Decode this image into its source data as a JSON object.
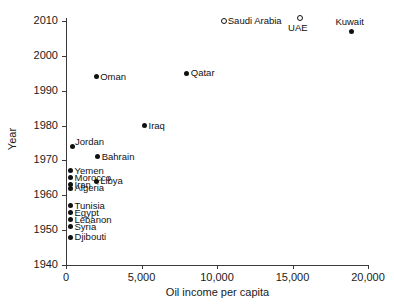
{
  "chart_data": {
    "type": "scatter",
    "title": "",
    "xlabel": "Oil income per capita",
    "ylabel": "Year",
    "xlim": [
      0,
      20000
    ],
    "ylim": [
      1940,
      2010
    ],
    "grid": false,
    "legend": "none",
    "xticks": [
      {
        "value": 0,
        "label": "0"
      },
      {
        "value": 5000,
        "label": "5,000"
      },
      {
        "value": 10000,
        "label": "10,000"
      },
      {
        "value": 15000,
        "label": "15,000"
      },
      {
        "value": 20000,
        "label": "20,000"
      }
    ],
    "yticks": [
      {
        "value": 1940,
        "label": "1940"
      },
      {
        "value": 1950,
        "label": "1950"
      },
      {
        "value": 1960,
        "label": "1960"
      },
      {
        "value": 1970,
        "label": "1970"
      },
      {
        "value": 1980,
        "label": "1980"
      },
      {
        "value": 1990,
        "label": "1990"
      },
      {
        "value": 2000,
        "label": "2000"
      },
      {
        "value": 2010,
        "label": "2010"
      }
    ],
    "points": [
      {
        "name": "Saudi Arabia",
        "x": 10450,
        "y": 2010,
        "marker": "open-circle",
        "label_pos": "right"
      },
      {
        "name": "UAE",
        "x": 15500,
        "y": 2011,
        "marker": "open-circle",
        "label_pos": "below"
      },
      {
        "name": "Kuwait",
        "x": 18900,
        "y": 2007,
        "marker": "filled-circle",
        "label_pos": "above"
      },
      {
        "name": "Qatar",
        "x": 8000,
        "y": 1995,
        "marker": "filled-circle",
        "label_pos": "right"
      },
      {
        "name": "Oman",
        "x": 2000,
        "y": 1994,
        "marker": "filled-circle",
        "label_pos": "right"
      },
      {
        "name": "Iraq",
        "x": 5200,
        "y": 1980,
        "marker": "filled-circle",
        "label_pos": "right"
      },
      {
        "name": "Jordan",
        "x": 400,
        "y": 1974,
        "marker": "filled-circle",
        "label_pos": "above-right"
      },
      {
        "name": "Bahrain",
        "x": 2100,
        "y": 1971,
        "marker": "filled-circle",
        "label_pos": "right"
      },
      {
        "name": "Yemen",
        "x": 300,
        "y": 1967,
        "marker": "filled-circle",
        "label_pos": "right"
      },
      {
        "name": "Morocco",
        "x": 300,
        "y": 1965,
        "marker": "filled-circle",
        "label_pos": "right"
      },
      {
        "name": "Libya",
        "x": 2000,
        "y": 1964,
        "marker": "filled-circle",
        "label_pos": "right"
      },
      {
        "name": "Iran",
        "x": 300,
        "y": 1963,
        "marker": "filled-circle",
        "label_pos": "right"
      },
      {
        "name": "Algeria",
        "x": 300,
        "y": 1962,
        "marker": "filled-circle",
        "label_pos": "right"
      },
      {
        "name": "Tunisia",
        "x": 300,
        "y": 1957,
        "marker": "filled-circle",
        "label_pos": "right"
      },
      {
        "name": "Egypt",
        "x": 300,
        "y": 1955,
        "marker": "filled-circle",
        "label_pos": "right"
      },
      {
        "name": "Lebanon",
        "x": 300,
        "y": 1953,
        "marker": "filled-circle",
        "label_pos": "right"
      },
      {
        "name": "Syria",
        "x": 300,
        "y": 1951,
        "marker": "filled-circle",
        "label_pos": "right"
      },
      {
        "name": "Djibouti",
        "x": 300,
        "y": 1948,
        "marker": "filled-circle",
        "label_pos": "right"
      }
    ]
  },
  "colors": {
    "marker": "#111111",
    "axis": "#3a3a3a",
    "background": "#ffffff",
    "text": "#1a1a1a"
  }
}
